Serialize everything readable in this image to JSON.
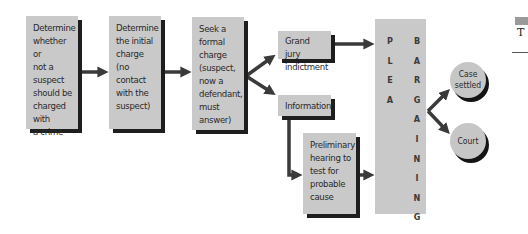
{
  "diagram": {
    "steps": [
      {
        "id": "step-1",
        "text": "Determine\nwhether or\nnot a suspect\nshould be\ncharged with\na crime"
      },
      {
        "id": "step-2",
        "text": "Determine\nthe initial\ncharge\n(no contact\nwith the\nsuspect)"
      },
      {
        "id": "step-3",
        "text": "Seek a\nformal\ncharge\n(suspect,\nnow a\ndefendant,\nmust\nanswer)"
      }
    ],
    "branches": {
      "grand_jury": "Grand jury\nindictment",
      "information": "Information",
      "preliminary_hearing": "Preliminary\nhearing to\ntest for\nprobable\ncause"
    },
    "plea_bargaining": {
      "col1": "P\nL\nE\nA",
      "col2": "B\nA\nR\nG\nA\nI\nN\nI\nN\nG"
    },
    "outcomes": {
      "case_settled": "Case\nsettled",
      "court": "Court"
    },
    "edge_fragment": {
      "letter": "T"
    },
    "colors": {
      "box_fill": "#c9c9c9",
      "shadow": "#1e1e1e",
      "arrow": "#3a3a3a"
    }
  }
}
